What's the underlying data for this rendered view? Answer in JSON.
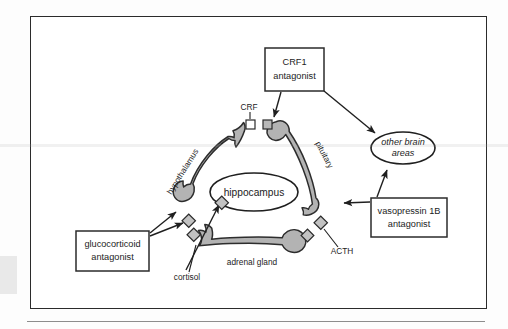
{
  "figure": {
    "type": "biological-pathway-diagram",
    "frame": {
      "border_color": "#2b2b2b",
      "background": "#ffffff"
    }
  },
  "colors": {
    "organ_fill": "#b3b3b3",
    "organ_stroke": "#2d2d2d",
    "text": "#1c1c1c",
    "frame": "#2b2b2b",
    "receptor_square_fill": "#ffffff",
    "receptor_diamond_fill": "#c2c2c2"
  },
  "nodes": {
    "hippocampus": {
      "label": "hippocampus",
      "shape": "ellipse"
    },
    "other_brain_areas": {
      "label_line1": "other brain",
      "label_line2": "areas",
      "shape": "ellipse",
      "style": "italic"
    }
  },
  "organs": {
    "hypothalamus": {
      "label": "hypothalamus",
      "rotation_deg": -58
    },
    "pituitary": {
      "label": "pituitary",
      "rotation_deg": 62
    },
    "adrenal_gland": {
      "label": "adrenal gland",
      "rotation_deg": 0
    }
  },
  "signals": {
    "crf": {
      "label": "CRF"
    },
    "acth": {
      "label": "ACTH"
    },
    "cortisol": {
      "label": "cortisol"
    }
  },
  "callouts": [
    {
      "id": "crf1-antagonist",
      "line1": "CRF1",
      "line2": "antagonist"
    },
    {
      "id": "vasopressin-1b-antagonist",
      "line1": "vasopressin 1B",
      "line2": "antagonist"
    },
    {
      "id": "glucocorticoid-antagonist",
      "line1": "glucocorticoid",
      "line2": "antagonist"
    }
  ],
  "receptors": {
    "square_count": 2,
    "diamond_count": 4
  }
}
